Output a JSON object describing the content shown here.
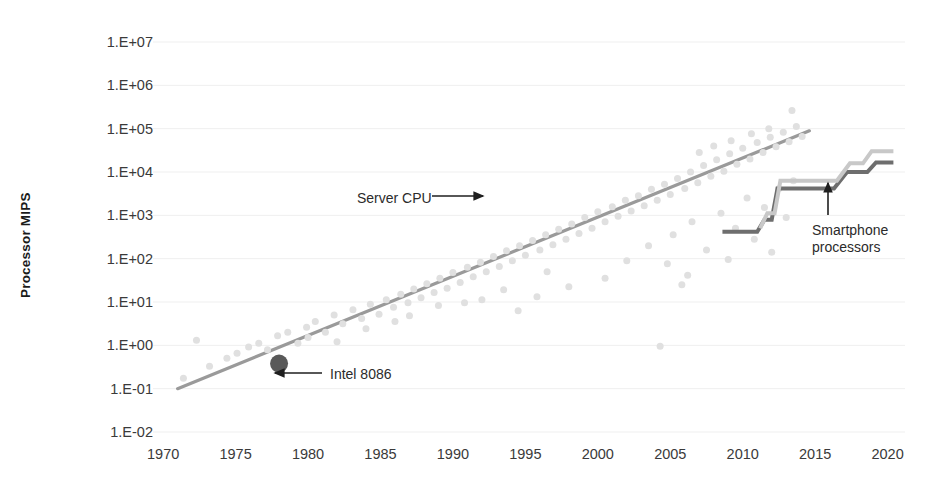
{
  "chart_data": {
    "type": "scatter",
    "title": "",
    "xlabel": "",
    "ylabel": "Processor MIPS",
    "xlim": [
      1969,
      2021
    ],
    "ylim": [
      -2,
      7
    ],
    "y_scale": "log10",
    "grid": true,
    "legend": "none",
    "x_ticks": [
      "1970",
      "1975",
      "1980",
      "1985",
      "1990",
      "1995",
      "2000",
      "2005",
      "2010",
      "2015",
      "2020"
    ],
    "y_ticks": [
      "1.E+07",
      "1.E+06",
      "1.E+05",
      "1.E+04",
      "1.E+03",
      "1.E+02",
      "1.E+01",
      "1.E+00",
      "1.E-01",
      "1.E-02"
    ],
    "y_tick_exponents": [
      7,
      6,
      5,
      4,
      3,
      2,
      1,
      0,
      -1,
      -2
    ],
    "series": [
      {
        "name": "Server CPU scatter",
        "type": "scatter",
        "color": "#e0e0e0",
        "marker": "circle",
        "marker_size": 7,
        "points": [
          [
            1971.4,
            -0.76
          ],
          [
            1972.3,
            0.12
          ],
          [
            1973.2,
            -0.48
          ],
          [
            1974.4,
            -0.3
          ],
          [
            1975.1,
            -0.18
          ],
          [
            1975.9,
            -0.04
          ],
          [
            1976.6,
            0.05
          ],
          [
            1977.2,
            -0.1
          ],
          [
            1977.9,
            0.22
          ],
          [
            1978.6,
            0.3
          ],
          [
            1979.3,
            0.05
          ],
          [
            1979.9,
            0.42
          ],
          [
            1980.5,
            0.55
          ],
          [
            1981.2,
            0.3
          ],
          [
            1981.8,
            0.7
          ],
          [
            1982.4,
            0.5
          ],
          [
            1983.1,
            0.82
          ],
          [
            1983.7,
            0.62
          ],
          [
            1984.3,
            0.95
          ],
          [
            1984.9,
            0.72
          ],
          [
            1985.4,
            1.05
          ],
          [
            1985.9,
            0.88
          ],
          [
            1986.4,
            1.18
          ],
          [
            1986.9,
            0.98
          ],
          [
            1987.3,
            1.3
          ],
          [
            1987.8,
            1.1
          ],
          [
            1988.2,
            1.42
          ],
          [
            1988.7,
            1.22
          ],
          [
            1989.1,
            1.55
          ],
          [
            1989.6,
            1.32
          ],
          [
            1990.0,
            1.68
          ],
          [
            1990.5,
            1.45
          ],
          [
            1991.0,
            1.8
          ],
          [
            1991.4,
            1.58
          ],
          [
            1991.9,
            1.92
          ],
          [
            1992.3,
            1.7
          ],
          [
            1992.8,
            2.05
          ],
          [
            1993.2,
            1.82
          ],
          [
            1993.7,
            2.18
          ],
          [
            1994.1,
            1.95
          ],
          [
            1994.6,
            2.3
          ],
          [
            1995.0,
            2.08
          ],
          [
            1995.5,
            2.42
          ],
          [
            1996.0,
            2.2
          ],
          [
            1996.4,
            2.55
          ],
          [
            1996.9,
            2.32
          ],
          [
            1997.3,
            2.68
          ],
          [
            1997.8,
            2.45
          ],
          [
            1998.2,
            2.8
          ],
          [
            1998.7,
            2.58
          ],
          [
            1999.1,
            2.95
          ],
          [
            1999.6,
            2.7
          ],
          [
            2000.0,
            3.08
          ],
          [
            2000.5,
            2.85
          ],
          [
            2001.0,
            3.2
          ],
          [
            2001.4,
            2.98
          ],
          [
            2001.9,
            3.35
          ],
          [
            2002.3,
            3.1
          ],
          [
            2002.8,
            3.45
          ],
          [
            2003.2,
            3.22
          ],
          [
            2003.7,
            3.6
          ],
          [
            2004.1,
            3.35
          ],
          [
            2004.6,
            3.72
          ],
          [
            2005.0,
            3.48
          ],
          [
            2005.5,
            3.85
          ],
          [
            2006.0,
            3.62
          ],
          [
            2006.4,
            4.0
          ],
          [
            2006.9,
            3.75
          ],
          [
            2007.3,
            4.15
          ],
          [
            2007.8,
            3.9
          ],
          [
            2008.2,
            4.28
          ],
          [
            2008.7,
            4.02
          ],
          [
            2009.1,
            4.42
          ],
          [
            2009.6,
            4.18
          ],
          [
            2010.0,
            4.55
          ],
          [
            2010.5,
            4.3
          ],
          [
            2011.0,
            4.68
          ],
          [
            2011.4,
            4.45
          ],
          [
            2011.9,
            4.8
          ],
          [
            2012.3,
            4.58
          ],
          [
            2012.8,
            4.92
          ],
          [
            2013.2,
            4.7
          ],
          [
            2013.7,
            5.05
          ],
          [
            2014.1,
            4.82
          ],
          [
            1986.0,
            0.55
          ],
          [
            1989.0,
            0.92
          ],
          [
            1992.0,
            1.05
          ],
          [
            1994.5,
            0.8
          ],
          [
            1996.5,
            1.7
          ],
          [
            1998.0,
            1.35
          ],
          [
            2000.5,
            1.55
          ],
          [
            2002.0,
            1.95
          ],
          [
            2003.5,
            2.3
          ],
          [
            2004.3,
            -0.02
          ],
          [
            2005.2,
            2.55
          ],
          [
            2006.5,
            2.85
          ],
          [
            2007.5,
            2.2
          ],
          [
            2008.5,
            3.05
          ],
          [
            2009.5,
            2.7
          ],
          [
            2010.3,
            3.4
          ],
          [
            2011.5,
            3.18
          ],
          [
            2012.5,
            3.62
          ],
          [
            2013.0,
            2.95
          ],
          [
            2013.5,
            3.8
          ],
          [
            2005.8,
            1.4
          ],
          [
            2004.8,
            1.88
          ],
          [
            2006.2,
            1.62
          ],
          [
            2009.0,
            1.98
          ],
          [
            2010.8,
            2.45
          ],
          [
            2012.0,
            2.15
          ],
          [
            2007.0,
            4.45
          ],
          [
            2008.0,
            4.6
          ],
          [
            2009.2,
            4.72
          ],
          [
            2010.6,
            4.88
          ],
          [
            2011.8,
            5.0
          ],
          [
            2013.4,
            5.42
          ],
          [
            1980.0,
            0.18
          ],
          [
            1982.0,
            0.08
          ],
          [
            1984.0,
            0.38
          ],
          [
            1987.0,
            0.68
          ],
          [
            1990.8,
            0.98
          ],
          [
            1993.5,
            1.28
          ],
          [
            1995.8,
            1.12
          ]
        ]
      },
      {
        "name": "Server CPU trend",
        "type": "line",
        "color": "#9a9a9a",
        "width": 3.2,
        "points": [
          [
            1971.0,
            -1.0
          ],
          [
            2014.6,
            4.95
          ]
        ]
      },
      {
        "name": "Smartphone processors (dark)",
        "type": "step",
        "color": "#6e6e6e",
        "width": 4,
        "points": [
          [
            2008.6,
            2.62
          ],
          [
            2011.0,
            2.62
          ],
          [
            2011.5,
            2.9
          ],
          [
            2012.0,
            2.9
          ],
          [
            2012.4,
            3.62
          ],
          [
            2016.3,
            3.62
          ],
          [
            2017.2,
            4.0
          ],
          [
            2018.6,
            4.0
          ],
          [
            2019.2,
            4.22
          ],
          [
            2020.4,
            4.22
          ]
        ]
      },
      {
        "name": "Smartphone processors (light)",
        "type": "step",
        "color": "#c8c8c8",
        "width": 4,
        "points": [
          [
            2011.2,
            2.7
          ],
          [
            2011.7,
            3.05
          ],
          [
            2012.2,
            3.05
          ],
          [
            2012.6,
            3.8
          ],
          [
            2016.5,
            3.8
          ],
          [
            2017.4,
            4.2
          ],
          [
            2018.3,
            4.2
          ],
          [
            2018.9,
            4.48
          ],
          [
            2020.4,
            4.48
          ]
        ]
      }
    ],
    "highlight_point": {
      "name": "Intel 8086",
      "x": 1978.0,
      "y": -0.42,
      "color": "#595959",
      "radius": 9
    },
    "annotations": [
      {
        "name": "server-cpu",
        "text": "Server CPU",
        "arrow": "right",
        "text_x": 357,
        "text_y": 190,
        "arrow_x1": 432,
        "arrow_y1": 196,
        "arrow_x2": 483,
        "arrow_y2": 196
      },
      {
        "name": "intel-8086",
        "text": "Intel 8086",
        "arrow": "left",
        "text_x": 330,
        "text_y": 366,
        "arrow_x1": 322,
        "arrow_y1": 373,
        "arrow_x2": 275,
        "arrow_y2": 373
      },
      {
        "name": "smartphone-processors",
        "text": "Smartphone processors",
        "arrow": "up",
        "text_x": 812,
        "text_y": 222,
        "arrow_x1": 828,
        "arrow_y1": 215,
        "arrow_x2": 828,
        "arrow_y2": 183
      }
    ]
  },
  "axes": {
    "y_title": "Processor MIPS"
  },
  "colors": {
    "scatter": "#e0e0e0",
    "trend": "#9a9a9a",
    "step_dark": "#6e6e6e",
    "step_light": "#c8c8c8",
    "highlight": "#595959",
    "grid": "#efefef",
    "text": "#3a3a3a",
    "background": "#ffffff"
  }
}
